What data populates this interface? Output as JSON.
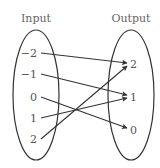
{
  "diagram": {
    "type": "mapping",
    "input_title": "Input",
    "output_title": "Output",
    "inputs": [
      {
        "label": "−2",
        "x": 36,
        "y": 53
      },
      {
        "label": "−1",
        "x": 36,
        "y": 74
      },
      {
        "label": "0",
        "x": 36,
        "y": 97
      },
      {
        "label": "1",
        "x": 36,
        "y": 118
      },
      {
        "label": "2",
        "x": 36,
        "y": 139
      }
    ],
    "outputs": [
      {
        "label": "2",
        "x": 133,
        "y": 64
      },
      {
        "label": "1",
        "x": 133,
        "y": 97
      },
      {
        "label": "0",
        "x": 133,
        "y": 130
      }
    ],
    "mappings": [
      {
        "from": "−2",
        "to": "2"
      },
      {
        "from": "−1",
        "to": "1"
      },
      {
        "from": "0",
        "to": "0"
      },
      {
        "from": "1",
        "to": "1"
      },
      {
        "from": "2",
        "to": "2"
      }
    ],
    "colors": {
      "stroke": "#333333",
      "text": "#555555"
    }
  }
}
